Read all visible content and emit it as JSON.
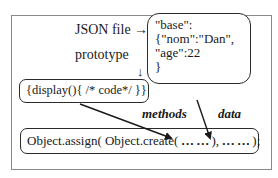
{
  "diagram": {
    "labels": {
      "json_file": "JSON file →",
      "prototype": "prototype",
      "down_arrow": "↓",
      "methods": "methods",
      "data": "data"
    },
    "json_box": {
      "lines": [
        "\"base\":",
        "{\"nom\":\"Dan\",",
        "\"age\":22",
        "}"
      ]
    },
    "prototype_box": {
      "code": "{display(){ /* code*/ }}"
    },
    "assign_box": {
      "part1": "Object.assign( Object.create(",
      "dots1": " … … ",
      "part2": "),",
      "dots2": " … … ",
      "part3": " );"
    },
    "arrows": [
      {
        "name": "methods-arrow",
        "from": "prototype_box",
        "to": "assign_box.dots1"
      },
      {
        "name": "data-arrow",
        "from": "json_box",
        "to": "assign_box.dots2"
      }
    ]
  }
}
